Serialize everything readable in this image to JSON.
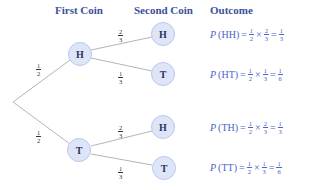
{
  "headers": {
    "first_coin": "First Coin",
    "second_coin": "Second Coin",
    "outcome": "Outcome"
  },
  "colors": {
    "header": "#3b4f9e",
    "formula": "#4a63c8",
    "node_fill": "#dfe5f8",
    "node_border": "#bcc6ec",
    "edge": "#b5b5b5"
  },
  "tree": {
    "root_to_first": [
      {
        "label_num": "1",
        "label_den": "2",
        "node": "H"
      },
      {
        "label_num": "1",
        "label_den": "2",
        "node": "T"
      }
    ],
    "first_to_second": [
      {
        "from": "H",
        "label_num": "2",
        "label_den": "3",
        "node": "H"
      },
      {
        "from": "H",
        "label_num": "1",
        "label_den": "3",
        "node": "T"
      },
      {
        "from": "T",
        "label_num": "2",
        "label_den": "3",
        "node": "H"
      },
      {
        "from": "T",
        "label_num": "1",
        "label_den": "3",
        "node": "T"
      }
    ]
  },
  "outcomes": [
    {
      "p": "P",
      "event": "(HH)",
      "eq": "=",
      "a_num": "1",
      "a_den": "2",
      "times": "×",
      "b_num": "2",
      "b_den": "3",
      "eq2": "=",
      "r_num": "1",
      "r_den": "3"
    },
    {
      "p": "P",
      "event": "(HT)",
      "eq": "=",
      "a_num": "1",
      "a_den": "2",
      "times": "×",
      "b_num": "1",
      "b_den": "3",
      "eq2": "=",
      "r_num": "1",
      "r_den": "6"
    },
    {
      "p": "P",
      "event": "(TH)",
      "eq": "=",
      "a_num": "1",
      "a_den": "2",
      "times": "×",
      "b_num": "2",
      "b_den": "3",
      "eq2": "=",
      "r_num": "1",
      "r_den": "3"
    },
    {
      "p": "P",
      "event": "(TT)",
      "eq": "=",
      "a_num": "1",
      "a_den": "2",
      "times": "×",
      "b_num": "1",
      "b_den": "3",
      "eq2": "=",
      "r_num": "1",
      "r_den": "6"
    }
  ]
}
